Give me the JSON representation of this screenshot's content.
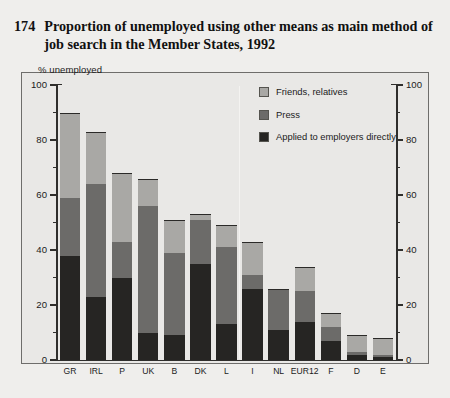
{
  "figure": {
    "number": "174",
    "title": "Proportion of unemployed using other means as main method of job search in the Member States, 1992"
  },
  "axis_caption": "% unemployed",
  "legend": {
    "position": "inside-top-right",
    "items": [
      {
        "label": "Friends, relatives",
        "color": "#a9a8a5",
        "key": "friends_relatives"
      },
      {
        "label": "Press",
        "color": "#6c6b69",
        "key": "press"
      },
      {
        "label": "Applied to employers directly",
        "color": "#262523",
        "key": "applied_directly"
      }
    ]
  },
  "chart_data": {
    "type": "bar",
    "subtype": "stacked-vertical",
    "title": "Proportion of unemployed using other means as main method of job search in the Member States, 1992",
    "xlabel": "",
    "ylabel": "% unemployed",
    "ylim": [
      0,
      100
    ],
    "yticks": [
      0,
      20,
      40,
      60,
      80,
      100
    ],
    "yticks_minor": [
      10,
      30,
      50,
      70,
      90
    ],
    "ytick_labels": [
      "0",
      "20",
      "40",
      "60",
      "80",
      "100"
    ],
    "right_axis_mirrors_left": true,
    "grid": false,
    "categories": [
      "GR",
      "IRL",
      "P",
      "UK",
      "B",
      "DK",
      "L",
      "I",
      "NL",
      "EUR12",
      "F",
      "D",
      "E"
    ],
    "series": [
      {
        "name": "Applied to employers directly",
        "color": "#262523",
        "values": [
          38,
          23,
          30,
          10,
          9,
          35,
          13,
          26,
          11,
          14,
          7,
          2,
          1
        ]
      },
      {
        "name": "Press",
        "color": "#6c6b69",
        "values": [
          21,
          41,
          13,
          46,
          30,
          16,
          28,
          5,
          15,
          11,
          5,
          1,
          1
        ]
      },
      {
        "name": "Friends, relatives",
        "color": "#a9a8a5",
        "values": [
          31,
          19,
          25,
          10,
          12,
          2,
          8,
          12,
          0,
          9,
          5,
          6,
          6
        ]
      }
    ],
    "totals": [
      90,
      83,
      68,
      66,
      51,
      53,
      49,
      43,
      26,
      34,
      17,
      9,
      8
    ],
    "group_divider_after_category": "L"
  },
  "colors": {
    "background": "#efeeec",
    "plot_background": "#e9e8e6",
    "axis": "#2f2e2c",
    "text": "#1b1b1b"
  }
}
